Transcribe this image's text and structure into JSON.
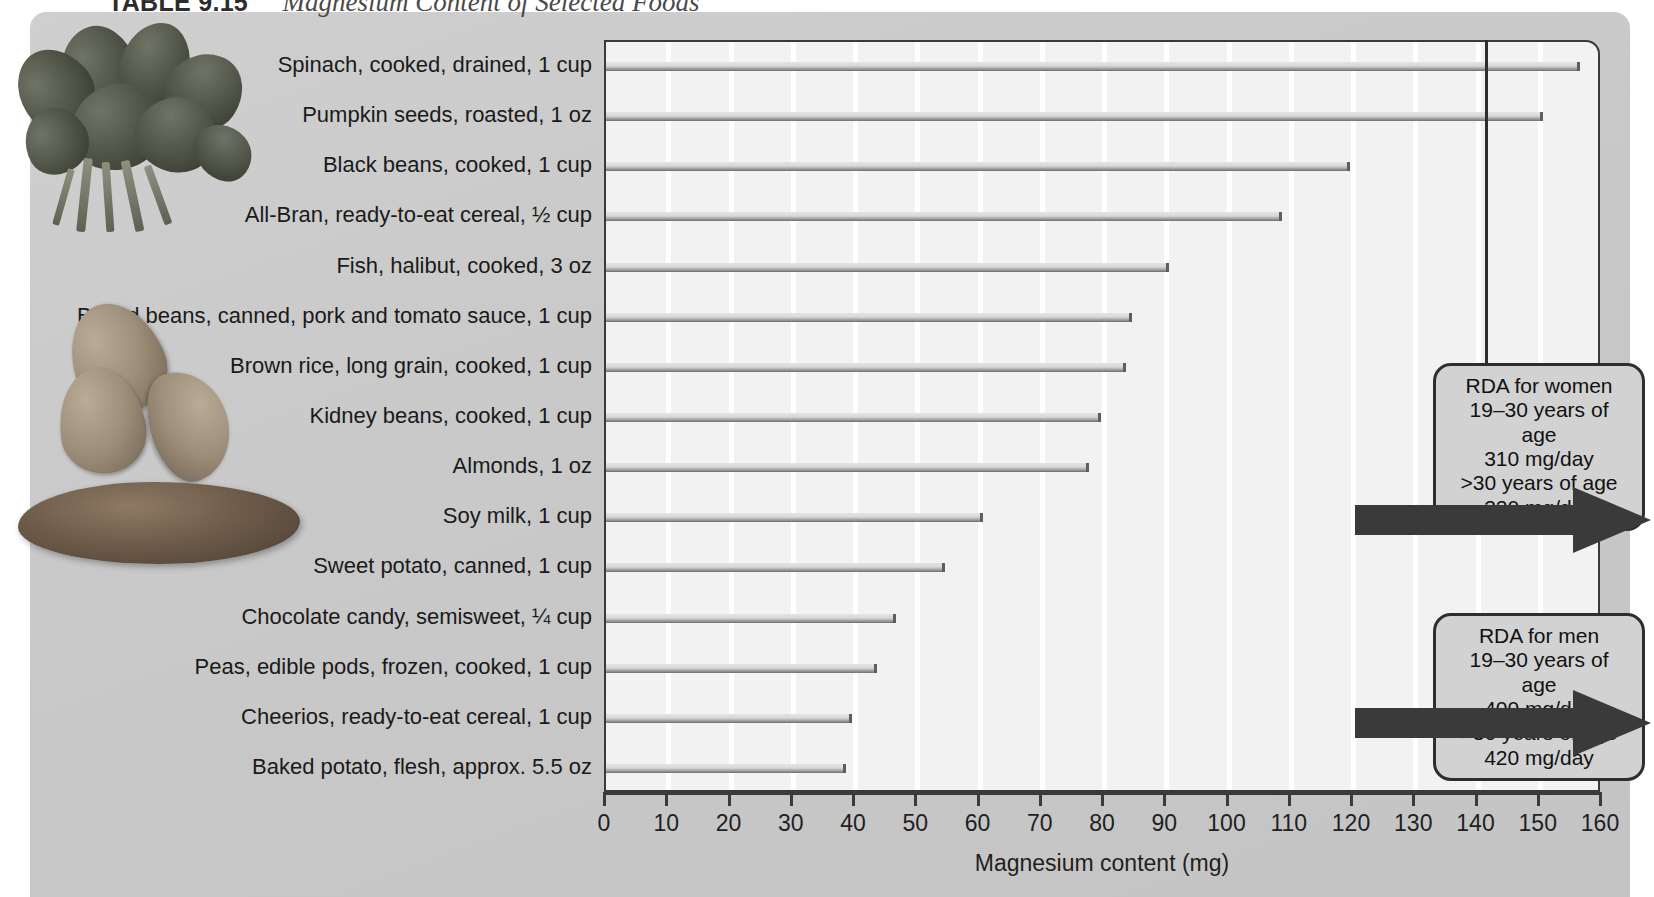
{
  "title": {
    "label": "TABLE 9.15",
    "text": "Magnesium Content of Selected Foods"
  },
  "chart_data": {
    "type": "bar",
    "orientation": "horizontal",
    "title": "Magnesium Content of Selected Foods",
    "xlabel": "Magnesium content (mg)",
    "ylabel": "",
    "xlim": [
      0,
      160
    ],
    "xticks": [
      0,
      10,
      20,
      30,
      40,
      50,
      60,
      70,
      80,
      90,
      100,
      110,
      120,
      130,
      140,
      150,
      160
    ],
    "grid": "vertical",
    "legend": "none",
    "categories": [
      "Spinach, cooked, drained, 1 cup",
      "Pumpkin seeds, roasted, 1 oz",
      "Black beans, cooked, 1 cup",
      "All-Bran, ready-to-eat cereal, ½ cup",
      "Fish, halibut, cooked, 3 oz",
      "Baked beans, canned, pork and tomato sauce, 1 cup",
      "Brown rice, long grain, cooked, 1 cup",
      "Kidney beans, cooked, 1 cup",
      "Almonds, 1 oz",
      "Soy milk, 1 cup",
      "Sweet potato, canned, 1 cup",
      "Chocolate candy, semisweet, ¼ cup",
      "Peas, edible pods, frozen, cooked, 1 cup",
      "Cheerios, ready-to-eat cereal, 1 cup",
      "Baked potato, flesh, approx. 5.5 oz"
    ],
    "values": [
      157,
      151,
      120,
      109,
      91,
      85,
      84,
      80,
      78,
      61,
      55,
      47,
      44,
      40,
      39
    ],
    "annotations": [
      {
        "name": "rda-women",
        "lines": [
          "RDA for women",
          "19–30 years of age",
          "310 mg/day",
          ">30 years of age",
          "320 mg/day"
        ]
      },
      {
        "name": "rda-men",
        "lines": [
          "RDA for men",
          "19–30 years of age",
          "400 mg/day",
          ">30 years of age",
          "420 mg/day"
        ]
      }
    ]
  },
  "callouts": {
    "women": {
      "line1": "RDA for women",
      "line2": "19–30 years of age",
      "line3": "310 mg/day",
      "line4": ">30 years of age",
      "line5": "320 mg/day"
    },
    "men": {
      "line1": "RDA for men",
      "line2": "19–30 years of age",
      "line3": "400 mg/day",
      "line4": ">30 years of age",
      "line5": "420 mg/day"
    }
  },
  "colors": {
    "panel": "#c9c9c9",
    "plot_bg": "#f2f2f2",
    "frame": "#3a3a3a",
    "bar": "#9a9a9a",
    "arrow": "#3a3a3a",
    "callout_bg": "#d2d2d2"
  },
  "photos": {
    "spinach": "spinach-photo",
    "almonds": "almonds-photo",
    "sweet_potato": "sweet-potato-photo"
  }
}
